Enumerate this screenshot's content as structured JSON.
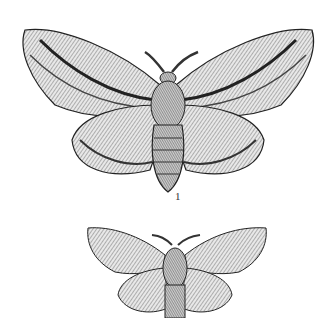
{
  "figure": {
    "specimens": [
      {
        "label": "1",
        "size": "large"
      },
      {
        "label": "",
        "size": "small",
        "cropped": true
      }
    ],
    "colors": {
      "ink": "#1a1a1a",
      "paper": "#ffffff",
      "mid": "#9a9a9a"
    }
  }
}
